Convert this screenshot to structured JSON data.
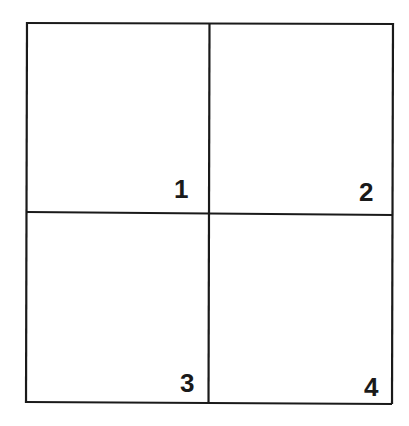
{
  "diagram": {
    "type": "quadrant-grid",
    "rows": 2,
    "cols": 2,
    "line_color": "#1a1a1a",
    "background": "#ffffff",
    "cells": [
      {
        "label": "1",
        "position": "top-left"
      },
      {
        "label": "2",
        "position": "top-right"
      },
      {
        "label": "3",
        "position": "bottom-left"
      },
      {
        "label": "4",
        "position": "bottom-right"
      }
    ]
  }
}
